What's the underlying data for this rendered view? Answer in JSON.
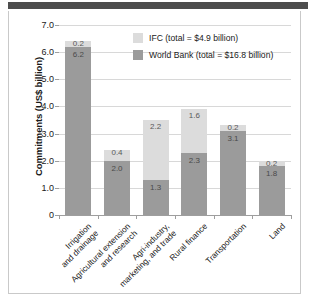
{
  "chart_data": {
    "type": "bar",
    "subtype": "stacked",
    "title": "",
    "xlabel": "",
    "ylabel": "Commitments (US$ billion)",
    "ylim": [
      0,
      7.0
    ],
    "ytick_step": 1.0,
    "ytick_labels": [
      "7.0",
      "6.0",
      "5.0",
      "4.0",
      "3.0",
      "2.0",
      "1.0",
      "0"
    ],
    "ytick_values": [
      7.0,
      6.0,
      5.0,
      4.0,
      3.0,
      2.0,
      1.0,
      0
    ],
    "grid": true,
    "legend_position": "upper-right-inside",
    "categories": [
      "Irrigation\nand drainage",
      "Agricultural extension\nand research",
      "Agri-industry,\nmarketing, and trade",
      "Rural finance",
      "Transportation",
      "Land"
    ],
    "series": [
      {
        "name": "World Bank (total = $16.8 billion)",
        "short_name": "World Bank",
        "color": "#9b9b9b",
        "total": 16.8,
        "values": [
          6.2,
          2.0,
          1.3,
          2.3,
          3.1,
          1.8
        ]
      },
      {
        "name": "IFC (total = $4.9 billion)",
        "short_name": "IFC",
        "color": "#dcdcdc",
        "total": 4.9,
        "values": [
          0.2,
          0.4,
          2.2,
          1.6,
          0.2,
          0.2
        ]
      }
    ],
    "stack_totals": [
      6.4,
      2.4,
      3.5,
      3.9,
      3.3,
      2.0
    ],
    "value_labels": {
      "world_bank": [
        "6.2",
        "2.0",
        "1.3",
        "2.3",
        "3.1",
        "1.8"
      ],
      "ifc": [
        "0.2",
        "0.4",
        "2.2",
        "1.6",
        "0.2",
        "0.2"
      ]
    }
  },
  "legend": {
    "items": [
      {
        "label": "IFC (total = $4.9 billion)",
        "color": "#dcdcdc"
      },
      {
        "label": "World Bank (total = $16.8 billion)",
        "color": "#9b9b9b"
      }
    ]
  },
  "axis": {
    "y_title": "Commitments (US$ billion)"
  },
  "colors": {
    "world_bank": "#9b9b9b",
    "ifc": "#dcdcdc",
    "gridline": "#d8d8d8",
    "axis": "#9e9e9e",
    "top_rule": "#4d4d4d",
    "panel_border": "#c9c9c9"
  }
}
